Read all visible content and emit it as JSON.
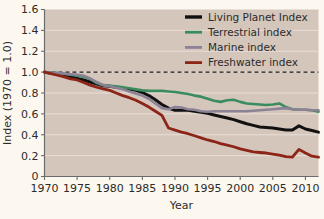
{
  "chart_data": {
    "type": "line",
    "title": "",
    "xlabel": "Year",
    "ylabel": "Index (1970 = 1.0)",
    "xlim": [
      1970,
      2012
    ],
    "ylim": [
      0,
      1.6
    ],
    "xticks": [
      1970,
      1975,
      1980,
      1985,
      1990,
      1995,
      2000,
      2005,
      2010
    ],
    "yticks": [
      0,
      0.2,
      0.4,
      0.6,
      0.8,
      1.0,
      1.2,
      1.4,
      1.6
    ],
    "ytick_labels": [
      "0",
      "0.2",
      "0.4",
      "0.6",
      "0.8",
      "1.0",
      "1.2",
      "1.4",
      "1.6"
    ],
    "xtick_labels": [
      "1970",
      "1975",
      "1980",
      "1985",
      "1990",
      "1995",
      "2000",
      "2005",
      "2010"
    ],
    "grid": true,
    "legend_position": "top-right",
    "reference_line": {
      "y": 1.0,
      "style": "dashed",
      "color": "#1a1a1a"
    },
    "x": [
      1970,
      1971,
      1972,
      1973,
      1974,
      1975,
      1976,
      1977,
      1978,
      1979,
      1980,
      1981,
      1982,
      1983,
      1984,
      1985,
      1986,
      1987,
      1988,
      1989,
      1990,
      1991,
      1992,
      1993,
      1994,
      1995,
      1996,
      1997,
      1998,
      1999,
      2000,
      2001,
      2002,
      2003,
      2004,
      2005,
      2006,
      2007,
      2008,
      2009,
      2010,
      2011,
      2012
    ],
    "series": [
      {
        "name": "Living Planet Index",
        "color": "#111111",
        "width": 3.0,
        "values": [
          1.0,
          0.99,
          0.98,
          0.97,
          0.955,
          0.94,
          0.925,
          0.905,
          0.885,
          0.87,
          0.865,
          0.855,
          0.845,
          0.835,
          0.825,
          0.805,
          0.775,
          0.735,
          0.69,
          0.655,
          0.635,
          0.635,
          0.635,
          0.625,
          0.615,
          0.605,
          0.59,
          0.575,
          0.56,
          0.545,
          0.525,
          0.505,
          0.49,
          0.475,
          0.47,
          0.465,
          0.455,
          0.445,
          0.445,
          0.485,
          0.455,
          0.44,
          0.425
        ]
      },
      {
        "name": "Terrestrial index",
        "color": "#3a8c5f",
        "width": 2.6,
        "values": [
          1.0,
          0.995,
          0.99,
          0.985,
          0.975,
          0.965,
          0.955,
          0.935,
          0.895,
          0.875,
          0.87,
          0.865,
          0.855,
          0.845,
          0.835,
          0.825,
          0.82,
          0.82,
          0.82,
          0.815,
          0.81,
          0.8,
          0.79,
          0.775,
          0.765,
          0.745,
          0.725,
          0.715,
          0.73,
          0.735,
          0.715,
          0.7,
          0.695,
          0.69,
          0.685,
          0.69,
          0.7,
          0.665,
          0.645,
          0.64,
          0.64,
          0.635,
          0.62
        ]
      },
      {
        "name": "Marine index",
        "color": "#8b8296",
        "width": 2.6,
        "values": [
          1.0,
          0.995,
          0.99,
          0.985,
          0.98,
          0.975,
          0.965,
          0.94,
          0.905,
          0.875,
          0.865,
          0.85,
          0.835,
          0.815,
          0.795,
          0.775,
          0.745,
          0.7,
          0.655,
          0.645,
          0.665,
          0.66,
          0.645,
          0.64,
          0.625,
          0.62,
          0.625,
          0.625,
          0.625,
          0.625,
          0.625,
          0.625,
          0.63,
          0.635,
          0.64,
          0.645,
          0.65,
          0.655,
          0.645,
          0.64,
          0.64,
          0.635,
          0.635
        ]
      },
      {
        "name": "Freshwater index",
        "color": "#8c2518",
        "width": 2.8,
        "values": [
          1.0,
          0.985,
          0.97,
          0.955,
          0.935,
          0.925,
          0.9,
          0.875,
          0.855,
          0.84,
          0.825,
          0.8,
          0.775,
          0.755,
          0.73,
          0.7,
          0.665,
          0.625,
          0.585,
          0.465,
          0.445,
          0.425,
          0.41,
          0.39,
          0.37,
          0.35,
          0.335,
          0.315,
          0.3,
          0.285,
          0.265,
          0.25,
          0.235,
          0.23,
          0.225,
          0.215,
          0.205,
          0.19,
          0.185,
          0.26,
          0.225,
          0.195,
          0.185
        ]
      }
    ]
  },
  "legend": {
    "items": [
      {
        "label": "Living Planet Index",
        "color": "#111111"
      },
      {
        "label": "Terrestrial index",
        "color": "#3a8c5f"
      },
      {
        "label": "Marine index",
        "color": "#8b8296"
      },
      {
        "label": "Freshwater index",
        "color": "#8c2518"
      }
    ]
  },
  "style": {
    "figure_background": "#fdf8ef",
    "plot_background": "#d5c6bc",
    "gridline_color": "#e8ded8",
    "axis_color": "#6b6b6b",
    "text_color": "#2b2b2b"
  }
}
